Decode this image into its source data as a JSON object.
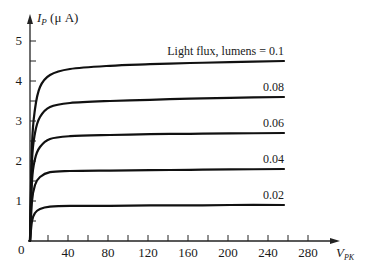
{
  "chart_data": {
    "type": "line",
    "title": "",
    "xlabel": "V_PK",
    "ylabel": "I_P (μ A)",
    "xlim": [
      0,
      290
    ],
    "ylim": [
      0,
      5.5
    ],
    "grid": false,
    "x_ticks": [
      20,
      40,
      60,
      80,
      100,
      120,
      140,
      160,
      180,
      200,
      220,
      240,
      260,
      280
    ],
    "x_tick_labels": [
      "40",
      "80",
      "120",
      "160",
      "200",
      "240",
      "280"
    ],
    "x_tick_label_values": [
      40,
      80,
      120,
      160,
      200,
      240,
      280
    ],
    "y_ticks": [
      0.5,
      1,
      1.5,
      2,
      2.5,
      3,
      3.5,
      4,
      4.5,
      5
    ],
    "y_tick_labels": [
      "1",
      "2",
      "3",
      "4",
      "5"
    ],
    "y_tick_label_values": [
      1,
      2,
      3,
      4,
      5
    ],
    "origin_label": "0",
    "series": [
      {
        "name": "Light flux, lumens = 0.1",
        "label": "Light flux, lumens = 0.1",
        "saturation": 4.5,
        "x": [
          0,
          2,
          5,
          10,
          20,
          40,
          80,
          120,
          160,
          200,
          254
        ],
        "values": [
          0,
          2.4,
          3.3,
          3.85,
          4.15,
          4.3,
          4.38,
          4.42,
          4.45,
          4.47,
          4.5
        ]
      },
      {
        "name": "0.08",
        "label": "0.08",
        "saturation": 3.6,
        "x": [
          0,
          2,
          5,
          10,
          20,
          40,
          80,
          120,
          160,
          200,
          254
        ],
        "values": [
          0,
          2.0,
          2.7,
          3.1,
          3.35,
          3.45,
          3.5,
          3.53,
          3.56,
          3.58,
          3.6
        ]
      },
      {
        "name": "0.06",
        "label": "0.06",
        "saturation": 2.7,
        "x": [
          0,
          2,
          5,
          10,
          20,
          40,
          80,
          120,
          160,
          200,
          254
        ],
        "values": [
          0,
          1.5,
          2.05,
          2.35,
          2.55,
          2.62,
          2.65,
          2.67,
          2.68,
          2.69,
          2.7
        ]
      },
      {
        "name": "0.04",
        "label": "0.04",
        "saturation": 1.8,
        "x": [
          0,
          2,
          5,
          10,
          20,
          40,
          80,
          120,
          160,
          200,
          254
        ],
        "values": [
          0,
          1.0,
          1.4,
          1.6,
          1.72,
          1.75,
          1.76,
          1.77,
          1.78,
          1.79,
          1.8
        ]
      },
      {
        "name": "0.02",
        "label": "0.02",
        "saturation": 0.9,
        "x": [
          0,
          2,
          5,
          10,
          20,
          40,
          80,
          120,
          160,
          200,
          254
        ],
        "values": [
          0,
          0.5,
          0.7,
          0.8,
          0.86,
          0.88,
          0.88,
          0.89,
          0.89,
          0.9,
          0.9
        ]
      }
    ]
  },
  "axes": {
    "y_title_main": "I",
    "y_title_sub": "P",
    "y_title_unit": " (μ A)",
    "x_title_main": "V",
    "x_title_sub": "PK"
  },
  "style": {
    "line_color": "#111111",
    "axis_color": "#222222"
  }
}
